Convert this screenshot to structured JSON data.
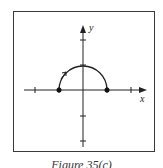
{
  "figure": {
    "caption": "Figure 35(c)",
    "axes": {
      "x_label": "x",
      "y_label": "y"
    },
    "curve": {
      "type": "upper semicircle",
      "center": [
        0,
        0
      ],
      "radius": 1,
      "endpoints": [
        [
          -1,
          0
        ],
        [
          1,
          0
        ]
      ],
      "endpoint_style": "filled dots",
      "direction": "clockwise (arrow on left side pointing up-right)"
    },
    "ticks": {
      "x": [
        -2,
        -1,
        1,
        2
      ],
      "y": [
        2,
        1,
        -1,
        -2
      ]
    },
    "colors": {
      "ink": "#222222",
      "frame": "#3a3a3a",
      "background": "#ffffff"
    }
  }
}
